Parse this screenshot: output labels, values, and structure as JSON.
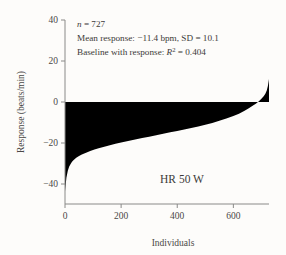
{
  "chart_data": {
    "type": "area",
    "title": "",
    "panel_label": "HR 50 W",
    "xlabel": "Individuals",
    "ylabel": "Response (beats/min)",
    "xlim": [
      0,
      727
    ],
    "ylim": [
      -46,
      40
    ],
    "xticks": [
      0,
      200,
      400,
      600
    ],
    "xticklabels": [
      "0",
      "200",
      "400",
      "600"
    ],
    "yticks": [
      40,
      20,
      0,
      -20,
      -40
    ],
    "yticklabels": [
      "40",
      "20",
      "0",
      "-20",
      "-40"
    ],
    "grid": false,
    "legend": "none",
    "baseline": 0,
    "series": [
      {
        "name": "Sorted individual response",
        "fill_color": "#000000",
        "x": [
          0,
          5,
          10,
          15,
          20,
          25,
          30,
          40,
          50,
          60,
          75,
          90,
          105,
          120,
          140,
          160,
          180,
          200,
          225,
          250,
          275,
          300,
          325,
          350,
          375,
          400,
          425,
          450,
          475,
          500,
          525,
          550,
          575,
          600,
          620,
          640,
          655,
          670,
          680,
          690,
          700,
          708,
          714,
          719,
          723,
          725,
          727
        ],
        "y": [
          -43.5,
          -37.0,
          -33.5,
          -31.5,
          -30.2,
          -29.2,
          -28.4,
          -27.2,
          -26.3,
          -25.6,
          -24.7,
          -23.9,
          -23.2,
          -22.6,
          -21.8,
          -21.1,
          -20.4,
          -19.8,
          -19.0,
          -18.3,
          -17.6,
          -16.9,
          -16.2,
          -15.5,
          -14.8,
          -14.1,
          -13.4,
          -12.7,
          -11.9,
          -11.1,
          -10.2,
          -9.2,
          -8.1,
          -6.8,
          -5.7,
          -4.3,
          -3.1,
          -1.7,
          -0.8,
          0.3,
          1.6,
          2.8,
          4.0,
          5.6,
          7.8,
          9.5,
          11.2
        ]
      }
    ],
    "annotations": {
      "n_label_italic": "n",
      "n_label_rest": " = 727",
      "line2": "Mean response: −11.4 bpm, SD = 10.1",
      "line3_prefix": "Baseline with response: ",
      "line3_stat_italic": "R",
      "line3_sup": "2",
      "line3_rest": " = 0.404"
    },
    "stats": {
      "n": 727,
      "mean_response_bpm": -11.4,
      "sd": 10.1,
      "r_squared": 0.404,
      "workload": "50 W",
      "measure": "HR"
    }
  }
}
